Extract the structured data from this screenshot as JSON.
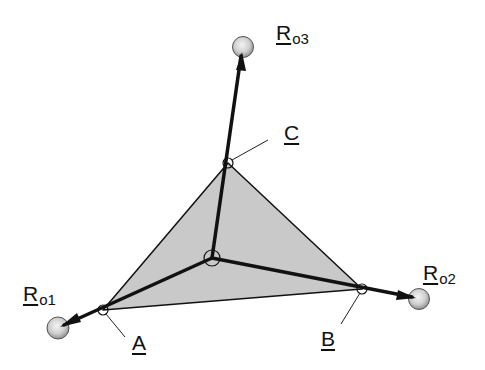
{
  "diagram": {
    "type": "tetrahedral vector diagram",
    "colors": {
      "face_fill": "#c9c9c9",
      "stroke": "#111111",
      "sphere_light": "#f2f2f2",
      "sphere_dark": "#9a9a9a"
    },
    "center": {
      "x": 212,
      "y": 258
    },
    "points": [
      {
        "id": "A",
        "x": 103,
        "y": 310
      },
      {
        "id": "B",
        "x": 362,
        "y": 289
      },
      {
        "id": "C",
        "x": 228,
        "y": 163
      }
    ],
    "spheres": [
      {
        "id": "Ro1",
        "x": 58,
        "y": 328
      },
      {
        "id": "Ro2",
        "x": 419,
        "y": 299
      },
      {
        "id": "Ro3",
        "x": 243,
        "y": 47
      }
    ]
  },
  "labels": {
    "ro1": {
      "main": "R",
      "sub": "o1"
    },
    "ro2": {
      "main": "R",
      "sub": "o2"
    },
    "ro3": {
      "main": "R",
      "sub": "o3"
    },
    "a": "A",
    "b": "B",
    "c": "C"
  }
}
